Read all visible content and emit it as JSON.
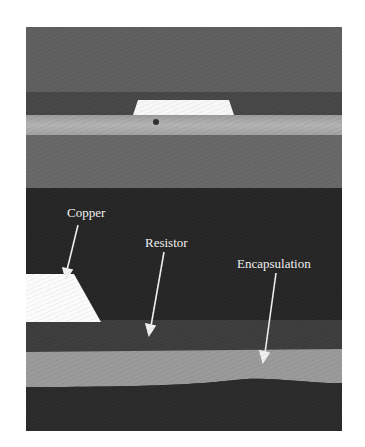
{
  "figure": {
    "top_panel": {
      "region_colors": {
        "upper_background": "#5f5f5f",
        "dark_band": "#474747",
        "copper_pad": "#f7f7f7",
        "light_band": "#a9a9a9",
        "lower_gray": "#6a6a6a"
      }
    },
    "bottom_panel": {
      "region_colors": {
        "dark_background": "#262626",
        "copper": "#fbfbfb",
        "resistor_layer": "#3f3f3f",
        "encapsulation": "#9a9a9a",
        "substrate": "#2c2c2c"
      },
      "labels": [
        {
          "text": "Copper",
          "x": 41,
          "y": 178
        },
        {
          "text": "Resistor",
          "x": 119,
          "y": 208
        },
        {
          "text": "Encapsulation",
          "x": 211,
          "y": 229
        }
      ],
      "arrows": [
        {
          "target": "Copper",
          "x1": 52,
          "y1": 198,
          "x2": 40,
          "y2": 250
        },
        {
          "target": "Resistor",
          "x1": 138,
          "y1": 225,
          "x2": 124,
          "y2": 306
        },
        {
          "target": "Encapsulation",
          "x1": 250,
          "y1": 246,
          "x2": 238,
          "y2": 333
        }
      ],
      "arrow_color": "#f0f0f0"
    }
  }
}
